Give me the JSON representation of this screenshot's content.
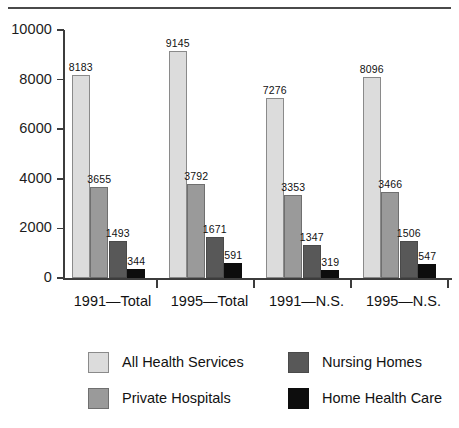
{
  "chart_data": {
    "type": "bar",
    "title": "",
    "subtitle": "",
    "xlabel": "",
    "ylabel": "",
    "ylim": [
      0,
      10000
    ],
    "yticks": [
      "0",
      "2000",
      "4000",
      "6000",
      "8000",
      "10000"
    ],
    "ytick_values": [
      0,
      2000,
      4000,
      6000,
      8000,
      10000
    ],
    "grid": false,
    "legend_position": "bottom",
    "categories": [
      "1991—Total",
      "1995—Total",
      "1991—N.S.",
      "1995—N.S."
    ],
    "series": [
      {
        "name": "All Health Services",
        "color": "#dcdcdc",
        "values": [
          8183,
          9145,
          7276,
          8096
        ]
      },
      {
        "name": "Private Hospitals",
        "color": "#9a9a9a",
        "values": [
          3655,
          3792,
          3353,
          3466
        ]
      },
      {
        "name": "Nursing Homes",
        "color": "#585858",
        "values": [
          1493,
          1671,
          1347,
          1506
        ]
      },
      {
        "name": "Home Health Care",
        "color": "#0d0d0d",
        "values": [
          344,
          591,
          319,
          547
        ]
      }
    ],
    "value_labels": [
      [
        "8183",
        "9145",
        "7276",
        "8096"
      ],
      [
        "3655",
        "3792",
        "3353",
        "3466"
      ],
      [
        "1493",
        "1671",
        "1347",
        "1506"
      ],
      [
        "344",
        "591",
        "319",
        "547"
      ]
    ]
  },
  "legend": {
    "entries": [
      {
        "label": "All Health Services",
        "swatch": "s0"
      },
      {
        "label": "Nursing Homes",
        "swatch": "s2"
      },
      {
        "label": "Private Hospitals",
        "swatch": "s1"
      },
      {
        "label": "Home Health Care",
        "swatch": "s3"
      }
    ]
  }
}
